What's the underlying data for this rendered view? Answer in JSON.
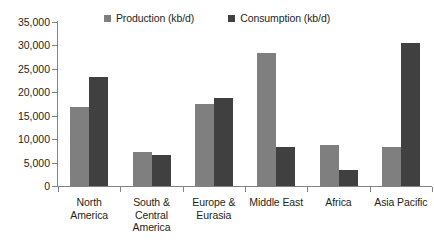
{
  "chart_data": {
    "type": "bar",
    "title": "",
    "subtitle": "",
    "xlabel": "",
    "ylabel": "",
    "ylim": [
      0,
      35000
    ],
    "grid": false,
    "legend_position": "top-center",
    "orientation": "vertical",
    "grouping": "clustered",
    "categories": [
      "North America",
      "South & Central America",
      "Europe & Eurasia",
      "Middle East",
      "Africa",
      "Asia Pacific"
    ],
    "category_lines": [
      [
        "North",
        "America"
      ],
      [
        "South &",
        "Central",
        "America"
      ],
      [
        "Europe &",
        "Eurasia"
      ],
      [
        "Middle East"
      ],
      [
        "Africa"
      ],
      [
        "Asia Pacific"
      ]
    ],
    "series": [
      {
        "name": "Production (kb/d)",
        "color": "#7f7f7f",
        "values": [
          16800,
          7200,
          17400,
          28300,
          8800,
          8300
        ]
      },
      {
        "name": "Consumption (kb/d)",
        "color": "#404040",
        "values": [
          23200,
          6600,
          18800,
          8400,
          3500,
          30500
        ]
      }
    ],
    "y_ticks": [
      0,
      5000,
      10000,
      15000,
      20000,
      25000,
      30000,
      35000
    ],
    "y_tick_labels": [
      "0",
      "5,000",
      "10,000",
      "15,000",
      "20,000",
      "25,000",
      "30,000",
      "35,000"
    ]
  },
  "axis": {
    "line_color": "#808285"
  },
  "background": {
    "plot_color": "#ffffff",
    "page_color": "#ffffff"
  }
}
